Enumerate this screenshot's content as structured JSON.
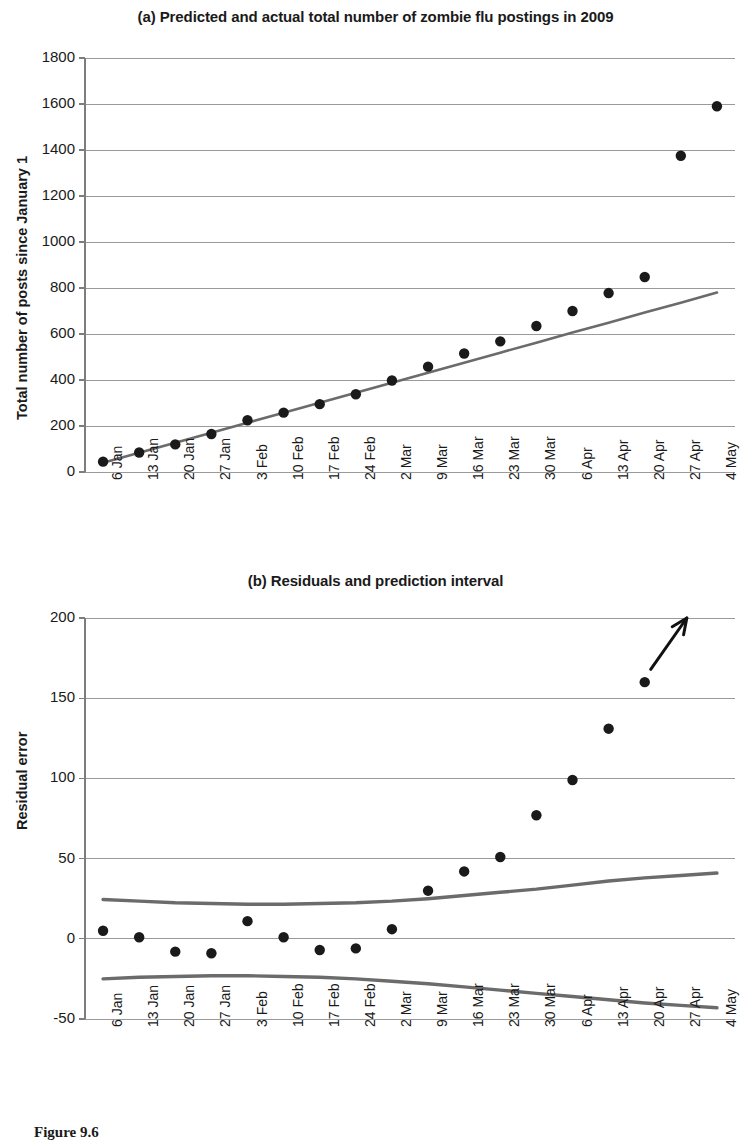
{
  "figure": {
    "caption": "Figure 9.6"
  },
  "chart_data": [
    {
      "id": "panel-a",
      "type": "scatter",
      "title": "(a) Predicted and actual total number of zombie flu postings in 2009",
      "xlabel": "",
      "ylabel": "Total number of posts since January 1",
      "ylim": [
        0,
        1800
      ],
      "ytick_step": 200,
      "yticks": [
        "0",
        "200",
        "400",
        "600",
        "800",
        "1000",
        "1200",
        "1400",
        "1600",
        "1800"
      ],
      "grid": true,
      "legend": "none",
      "categories": [
        "6 Jan",
        "13 Jan",
        "20 Jan",
        "27 Jan",
        "3 Feb",
        "10 Feb",
        "17 Feb",
        "24 Feb",
        "2 Mar",
        "9 Mar",
        "16 Mar",
        "23 Mar",
        "30 Mar",
        "6 Apr",
        "13 Apr",
        "20 Apr",
        "27 Apr",
        "4 May"
      ],
      "series": [
        {
          "name": "Actual postings",
          "style": "points",
          "values": [
            45,
            85,
            120,
            165,
            225,
            258,
            295,
            338,
            398,
            458,
            515,
            568,
            635,
            700,
            778,
            848,
            1375,
            1590
          ]
        },
        {
          "name": "Predicted (fitted line)",
          "style": "line",
          "values": [
            40,
            84,
            127,
            171,
            214,
            258,
            301,
            345,
            388,
            432,
            475,
            519,
            562,
            606,
            649,
            693,
            736,
            780
          ]
        }
      ]
    },
    {
      "id": "panel-b",
      "type": "scatter",
      "title": "(b) Residuals and prediction interval",
      "xlabel": "",
      "ylabel": "Residual error",
      "ylim": [
        -50,
        200
      ],
      "ytick_step": 50,
      "yticks": [
        "-50",
        "0",
        "50",
        "100",
        "150",
        "200"
      ],
      "grid": true,
      "legend": "none",
      "categories": [
        "6 Jan",
        "13 Jan",
        "20 Jan",
        "27 Jan",
        "3 Feb",
        "10 Feb",
        "17 Feb",
        "24 Feb",
        "2 Mar",
        "9 Mar",
        "16 Mar",
        "23 Mar",
        "30 Mar",
        "6 Apr",
        "13 Apr",
        "20 Apr",
        "27 Apr",
        "4 May"
      ],
      "series": [
        {
          "name": "Residuals",
          "style": "points",
          "values": [
            5,
            1,
            -8,
            -9,
            11,
            1,
            -7,
            -6,
            6,
            30,
            42,
            51,
            77,
            99,
            131,
            160,
            null,
            null
          ]
        },
        {
          "name": "Upper prediction interval",
          "style": "line",
          "values": [
            24.5,
            23.5,
            22.5,
            22,
            21.5,
            21.5,
            22,
            22.5,
            23.5,
            25,
            27,
            29,
            31,
            33.5,
            36,
            38,
            39.5,
            41
          ]
        },
        {
          "name": "Lower prediction interval",
          "style": "line",
          "values": [
            -25,
            -24,
            -23.5,
            -23,
            -23,
            -23.5,
            -24,
            -25,
            -26.5,
            -28,
            -30,
            -32,
            -34,
            -36,
            -38,
            -40,
            -41.5,
            -43
          ]
        }
      ],
      "annotations": [
        {
          "type": "arrow",
          "label": "",
          "from_x": "20 Apr",
          "from_y": 168,
          "to_x": "27 Apr",
          "to_y": 205
        }
      ]
    }
  ],
  "colors": {
    "point": "#1a1a1a",
    "fit_line": "#6b6b6b",
    "interval_line": "#6b6b6b",
    "grid": "#9a9a9a",
    "axis": "#7d7d7d",
    "text": "#1a1a1a",
    "background": "#ffffff"
  }
}
